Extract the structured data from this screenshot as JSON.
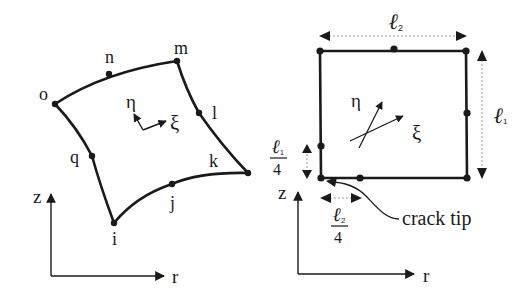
{
  "figure": {
    "left_element": {
      "title": "8-node curved isoparametric element",
      "nodes": [
        {
          "id": "o",
          "label": "o",
          "x": 55,
          "y": 104
        },
        {
          "id": "n",
          "label": "n",
          "x": 109,
          "y": 74
        },
        {
          "id": "m",
          "label": "m",
          "x": 177,
          "y": 61
        },
        {
          "id": "l",
          "label": "l",
          "x": 199,
          "y": 113
        },
        {
          "id": "k",
          "label": "k",
          "x": 248,
          "y": 173
        },
        {
          "id": "j",
          "label": "j",
          "x": 172,
          "y": 184
        },
        {
          "id": "i",
          "label": "i",
          "x": 114,
          "y": 223
        },
        {
          "id": "q",
          "label": "q",
          "x": 92,
          "y": 156
        }
      ],
      "local_axes": {
        "eta": "η",
        "xi": "ξ"
      },
      "global_axes": {
        "z": "z",
        "r": "r"
      }
    },
    "right_element": {
      "title": "Quarter-point crack tip element",
      "dimension_top": {
        "symbol": "ℓ",
        "subscript": "2"
      },
      "dimension_right": {
        "symbol": "ℓ",
        "subscript": "1"
      },
      "dimension_left_fraction": {
        "symbol": "ℓ",
        "subscript": "1",
        "denominator": "4"
      },
      "dimension_bottom_fraction": {
        "symbol": "ℓ",
        "subscript": "2",
        "denominator": "4"
      },
      "local_axes": {
        "eta": "η",
        "xi": "ξ"
      },
      "global_axes": {
        "z": "z",
        "r": "r"
      },
      "annotation": "crack tip"
    }
  },
  "colors": {
    "ink": "#1a1a1a",
    "dimension_line": "#9a9a9a",
    "background": "#ffffff"
  }
}
